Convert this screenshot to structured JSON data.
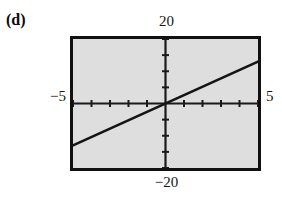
{
  "figure": {
    "panel_label": "(d)",
    "background_color": "#ffffff",
    "plot_background_color": "#dedede",
    "frame_color": "#111111",
    "axis_color": "#1a1a1a",
    "line_color": "#151515"
  },
  "labels": {
    "top": "20",
    "bottom": "−20",
    "left": "−5",
    "right": "5"
  },
  "chart_data": {
    "type": "line",
    "title": "",
    "xlabel": "",
    "ylabel": "",
    "xlim": [
      -5,
      5
    ],
    "ylim": [
      -20,
      20
    ],
    "xticks": [
      -5,
      -4,
      -3,
      -2,
      -1,
      0,
      1,
      2,
      3,
      4,
      5
    ],
    "yticks": [
      -20,
      -15,
      -10,
      -5,
      0,
      5,
      10,
      15,
      20
    ],
    "xtick_labels": [
      "−5",
      "",
      "",
      "",
      "",
      "",
      "",
      "",
      "",
      "",
      "5"
    ],
    "ytick_labels": [
      "−20",
      "",
      "",
      "",
      "",
      "",
      "",
      "",
      "20"
    ],
    "grid": false,
    "legend": false,
    "axes_style": "centered-cross",
    "series": [
      {
        "name": "line",
        "x": [
          -5,
          5
        ],
        "y": [
          -13,
          13
        ],
        "slope": 2.6,
        "intercept": 0,
        "color": "#151515",
        "linewidth": 2.5
      }
    ]
  }
}
